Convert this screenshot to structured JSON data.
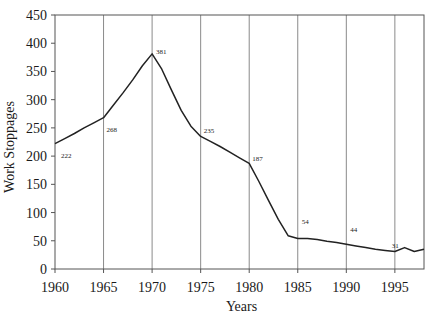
{
  "chart_data": {
    "type": "line",
    "title": "",
    "xlabel": "Years",
    "ylabel": "Work Stoppages",
    "xlim": [
      1960,
      1998
    ],
    "ylim": [
      0,
      450
    ],
    "x_ticks": [
      1960,
      1965,
      1970,
      1975,
      1980,
      1985,
      1990,
      1995
    ],
    "y_ticks": [
      0,
      50,
      100,
      150,
      200,
      250,
      300,
      350,
      400,
      450
    ],
    "grid": {
      "vertical": true,
      "horizontal": false
    },
    "legend": null,
    "series": [
      {
        "name": "Work Stoppages",
        "x": [
          1960,
          1961,
          1962,
          1963,
          1964,
          1965,
          1966,
          1967,
          1968,
          1969,
          1970,
          1971,
          1972,
          1973,
          1974,
          1975,
          1976,
          1977,
          1978,
          1979,
          1980,
          1981,
          1982,
          1983,
          1984,
          1985,
          1986,
          1987,
          1988,
          1989,
          1990,
          1991,
          1992,
          1993,
          1994,
          1995,
          1996,
          1997,
          1998
        ],
        "values": [
          222,
          231,
          240,
          250,
          259,
          268,
          290,
          312,
          335,
          360,
          381,
          354,
          317,
          281,
          253,
          235,
          226,
          217,
          207,
          197,
          187,
          155,
          121,
          88,
          59,
          54,
          54,
          52,
          49,
          47,
          44,
          41,
          38,
          35,
          33,
          31,
          38,
          31,
          35
        ]
      }
    ],
    "annotations": [
      {
        "x": 1960,
        "y": 222,
        "text": "222"
      },
      {
        "x": 1965,
        "y": 268,
        "text": "268"
      },
      {
        "x": 1970,
        "y": 381,
        "text": "381"
      },
      {
        "x": 1975,
        "y": 235,
        "text": "235"
      },
      {
        "x": 1980,
        "y": 187,
        "text": "187"
      },
      {
        "x": 1985,
        "y": 54,
        "text": "54"
      },
      {
        "x": 1990,
        "y": 44,
        "text": "44"
      },
      {
        "x": 1995,
        "y": 31,
        "text": "31"
      }
    ]
  },
  "axes": {
    "x_title": "Years",
    "y_title": "Work Stoppages"
  }
}
